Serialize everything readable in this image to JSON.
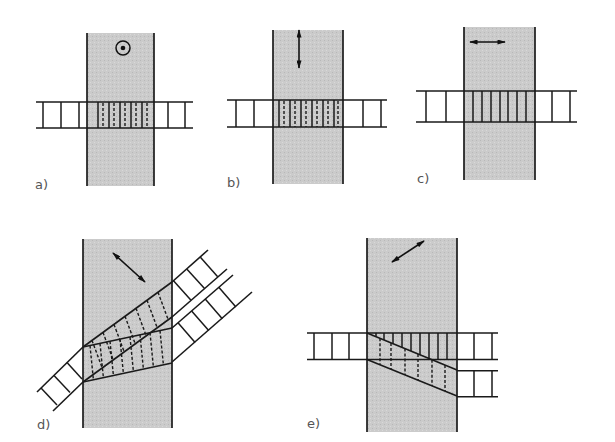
{
  "figure": {
    "background": "#ffffff",
    "band_color": "#cbcbcb",
    "line_color": "#1a1a1a",
    "panels": [
      {
        "label": "a)",
        "icon": "circle-dot-icon",
        "interior_rungs": "solid-and-dashed"
      },
      {
        "label": "b)",
        "icon": "vertical-double-arrow-icon",
        "interior_rungs": "solid-and-dashed"
      },
      {
        "label": "c)",
        "icon": "horizontal-double-arrow-icon",
        "interior_rungs": "solid"
      },
      {
        "label": "d)",
        "icon": "diagonal-double-arrow-icon",
        "interior_rungs": "dashed, split into two diverging ladders"
      },
      {
        "label": "e)",
        "icon": "diagonal-double-arrow-icon",
        "interior_rungs": "solid and dashed, split into two parallel ladders"
      }
    ]
  }
}
